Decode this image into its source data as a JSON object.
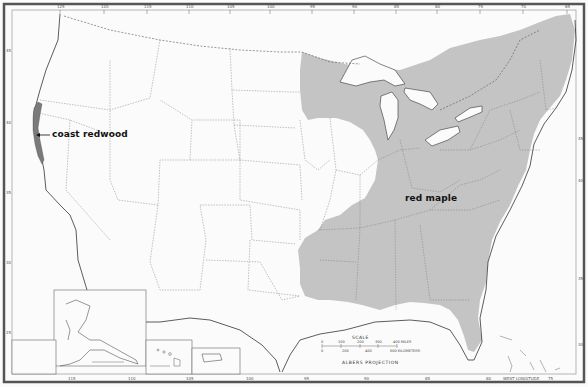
{
  "map": {
    "title": "Range map: coast redwood and red maple",
    "projection_label": "ALBERS PROJECTION",
    "colors": {
      "range_fill": "#c4c4c4",
      "redwood_fill": "#7a7a7a",
      "outline": "#333333",
      "state_border": "#777777",
      "frame": "#555555",
      "background": "#fbfbfb"
    },
    "species": [
      {
        "name": "coast redwood",
        "region": "Pacific coast of northern California and southwestern Oregon"
      },
      {
        "name": "red maple",
        "region": "Eastern United States and southeastern Canada"
      }
    ],
    "scale": {
      "title": "SCALE",
      "miles_ticks": [
        "0",
        "100",
        "200",
        "300",
        "400 MILES"
      ],
      "km_ticks": [
        "0",
        "200",
        "400",
        "600 KILOMETERS"
      ]
    },
    "top_longitudes": [
      "125",
      "120",
      "115",
      "110",
      "105",
      "100",
      "95",
      "90",
      "85",
      "80",
      "75",
      "70",
      "65"
    ],
    "bottom_longitudes": [
      "115",
      "110",
      "105",
      "100",
      "95",
      "90",
      "85",
      "80",
      "75"
    ],
    "bottom_caption": "WEST LONGITUDE",
    "left_latitudes": [
      "45",
      "40",
      "35",
      "30",
      "25"
    ],
    "right_latitudes": [
      "45",
      "40",
      "35",
      "30",
      "25"
    ],
    "insets": [
      {
        "name": "Alaska",
        "scale_label": "MILES"
      },
      {
        "name": "Hawaii",
        "scale_label": "MILES"
      },
      {
        "name": "Puerto Rico",
        "scale_label": "MILES"
      }
    ]
  }
}
